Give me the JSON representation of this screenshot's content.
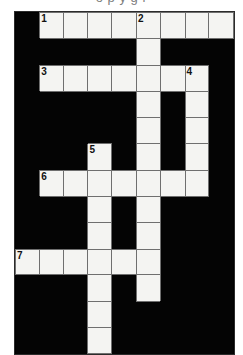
{
  "page": {
    "clipped_header_text": "o   p      y        g           r"
  },
  "puzzle": {
    "title": "",
    "columns": 9,
    "rows": 12,
    "cell_colors": {
      "open": "#f4f4f2",
      "block": "#040404",
      "grid_line": "#6f6f6f",
      "border": "#2b2b2b",
      "number": "#111111"
    },
    "grid": [
      [
        {
          "open": false,
          "num": "",
          "letter": ""
        },
        {
          "open": true,
          "num": "1",
          "letter": ""
        },
        {
          "open": true,
          "num": "",
          "letter": ""
        },
        {
          "open": true,
          "num": "",
          "letter": ""
        },
        {
          "open": true,
          "num": "",
          "letter": ""
        },
        {
          "open": true,
          "num": "2",
          "letter": ""
        },
        {
          "open": true,
          "num": "",
          "letter": ""
        },
        {
          "open": true,
          "num": "",
          "letter": ""
        },
        {
          "open": true,
          "num": "",
          "letter": ""
        }
      ],
      [
        {
          "open": false,
          "num": "",
          "letter": ""
        },
        {
          "open": false,
          "num": "",
          "letter": ""
        },
        {
          "open": false,
          "num": "",
          "letter": ""
        },
        {
          "open": false,
          "num": "",
          "letter": ""
        },
        {
          "open": false,
          "num": "",
          "letter": ""
        },
        {
          "open": true,
          "num": "",
          "letter": ""
        },
        {
          "open": false,
          "num": "",
          "letter": ""
        },
        {
          "open": false,
          "num": "",
          "letter": ""
        },
        {
          "open": false,
          "num": "",
          "letter": ""
        }
      ],
      [
        {
          "open": false,
          "num": "",
          "letter": ""
        },
        {
          "open": true,
          "num": "3",
          "letter": ""
        },
        {
          "open": true,
          "num": "",
          "letter": ""
        },
        {
          "open": true,
          "num": "",
          "letter": ""
        },
        {
          "open": true,
          "num": "",
          "letter": ""
        },
        {
          "open": true,
          "num": "",
          "letter": ""
        },
        {
          "open": true,
          "num": "",
          "letter": ""
        },
        {
          "open": true,
          "num": "4",
          "letter": ""
        },
        {
          "open": false,
          "num": "",
          "letter": ""
        }
      ],
      [
        {
          "open": false,
          "num": "",
          "letter": ""
        },
        {
          "open": false,
          "num": "",
          "letter": ""
        },
        {
          "open": false,
          "num": "",
          "letter": ""
        },
        {
          "open": false,
          "num": "",
          "letter": ""
        },
        {
          "open": false,
          "num": "",
          "letter": ""
        },
        {
          "open": true,
          "num": "",
          "letter": ""
        },
        {
          "open": false,
          "num": "",
          "letter": ""
        },
        {
          "open": true,
          "num": "",
          "letter": ""
        },
        {
          "open": false,
          "num": "",
          "letter": ""
        }
      ],
      [
        {
          "open": false,
          "num": "",
          "letter": ""
        },
        {
          "open": false,
          "num": "",
          "letter": ""
        },
        {
          "open": false,
          "num": "",
          "letter": ""
        },
        {
          "open": false,
          "num": "",
          "letter": ""
        },
        {
          "open": false,
          "num": "",
          "letter": ""
        },
        {
          "open": true,
          "num": "",
          "letter": ""
        },
        {
          "open": false,
          "num": "",
          "letter": ""
        },
        {
          "open": true,
          "num": "",
          "letter": ""
        },
        {
          "open": false,
          "num": "",
          "letter": ""
        }
      ],
      [
        {
          "open": false,
          "num": "",
          "letter": ""
        },
        {
          "open": false,
          "num": "",
          "letter": ""
        },
        {
          "open": false,
          "num": "",
          "letter": ""
        },
        {
          "open": true,
          "num": "5",
          "letter": ""
        },
        {
          "open": false,
          "num": "",
          "letter": ""
        },
        {
          "open": true,
          "num": "",
          "letter": ""
        },
        {
          "open": false,
          "num": "",
          "letter": ""
        },
        {
          "open": true,
          "num": "",
          "letter": ""
        },
        {
          "open": false,
          "num": "",
          "letter": ""
        }
      ],
      [
        {
          "open": false,
          "num": "",
          "letter": ""
        },
        {
          "open": true,
          "num": "6",
          "letter": ""
        },
        {
          "open": true,
          "num": "",
          "letter": ""
        },
        {
          "open": true,
          "num": "",
          "letter": ""
        },
        {
          "open": true,
          "num": "",
          "letter": ""
        },
        {
          "open": true,
          "num": "",
          "letter": ""
        },
        {
          "open": true,
          "num": "",
          "letter": ""
        },
        {
          "open": true,
          "num": "",
          "letter": ""
        },
        {
          "open": false,
          "num": "",
          "letter": ""
        }
      ],
      [
        {
          "open": false,
          "num": "",
          "letter": ""
        },
        {
          "open": false,
          "num": "",
          "letter": ""
        },
        {
          "open": false,
          "num": "",
          "letter": ""
        },
        {
          "open": true,
          "num": "",
          "letter": ""
        },
        {
          "open": false,
          "num": "",
          "letter": ""
        },
        {
          "open": true,
          "num": "",
          "letter": ""
        },
        {
          "open": false,
          "num": "",
          "letter": ""
        },
        {
          "open": false,
          "num": "",
          "letter": ""
        },
        {
          "open": false,
          "num": "",
          "letter": ""
        }
      ],
      [
        {
          "open": false,
          "num": "",
          "letter": ""
        },
        {
          "open": false,
          "num": "",
          "letter": ""
        },
        {
          "open": false,
          "num": "",
          "letter": ""
        },
        {
          "open": true,
          "num": "",
          "letter": ""
        },
        {
          "open": false,
          "num": "",
          "letter": ""
        },
        {
          "open": true,
          "num": "",
          "letter": ""
        },
        {
          "open": false,
          "num": "",
          "letter": ""
        },
        {
          "open": false,
          "num": "",
          "letter": ""
        },
        {
          "open": false,
          "num": "",
          "letter": ""
        }
      ],
      [
        {
          "open": true,
          "num": "7",
          "letter": ""
        },
        {
          "open": true,
          "num": "",
          "letter": ""
        },
        {
          "open": true,
          "num": "",
          "letter": ""
        },
        {
          "open": true,
          "num": "",
          "letter": ""
        },
        {
          "open": true,
          "num": "",
          "letter": ""
        },
        {
          "open": true,
          "num": "",
          "letter": ""
        },
        {
          "open": false,
          "num": "",
          "letter": ""
        },
        {
          "open": false,
          "num": "",
          "letter": ""
        },
        {
          "open": false,
          "num": "",
          "letter": ""
        }
      ],
      [
        {
          "open": false,
          "num": "",
          "letter": ""
        },
        {
          "open": false,
          "num": "",
          "letter": ""
        },
        {
          "open": false,
          "num": "",
          "letter": ""
        },
        {
          "open": true,
          "num": "",
          "letter": ""
        },
        {
          "open": false,
          "num": "",
          "letter": ""
        },
        {
          "open": true,
          "num": "",
          "letter": ""
        },
        {
          "open": false,
          "num": "",
          "letter": ""
        },
        {
          "open": false,
          "num": "",
          "letter": ""
        },
        {
          "open": false,
          "num": "",
          "letter": ""
        }
      ],
      [
        {
          "open": false,
          "num": "",
          "letter": ""
        },
        {
          "open": false,
          "num": "",
          "letter": ""
        },
        {
          "open": false,
          "num": "",
          "letter": ""
        },
        {
          "open": true,
          "num": "",
          "letter": ""
        },
        {
          "open": false,
          "num": "",
          "letter": ""
        },
        {
          "open": false,
          "num": "",
          "letter": ""
        },
        {
          "open": false,
          "num": "",
          "letter": ""
        },
        {
          "open": false,
          "num": "",
          "letter": ""
        },
        {
          "open": false,
          "num": "",
          "letter": ""
        }
      ],
      [
        {
          "open": false,
          "num": "",
          "letter": ""
        },
        {
          "open": false,
          "num": "",
          "letter": ""
        },
        {
          "open": false,
          "num": "",
          "letter": ""
        },
        {
          "open": true,
          "num": "",
          "letter": ""
        },
        {
          "open": false,
          "num": "",
          "letter": ""
        },
        {
          "open": false,
          "num": "",
          "letter": ""
        },
        {
          "open": false,
          "num": "",
          "letter": ""
        },
        {
          "open": false,
          "num": "",
          "letter": ""
        },
        {
          "open": false,
          "num": "",
          "letter": ""
        }
      ]
    ]
  }
}
